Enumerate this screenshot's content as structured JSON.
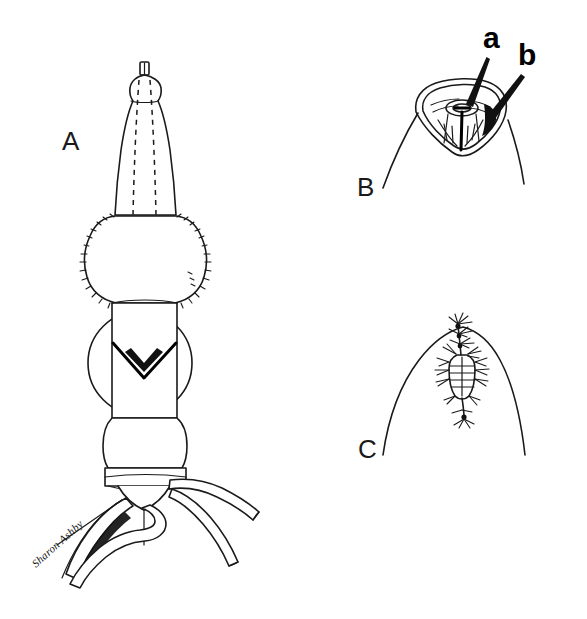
{
  "figure": {
    "background_color": "#ffffff",
    "ink_color": "#1a1a1a",
    "width": 587,
    "height": 619,
    "media": "pen-and-ink line drawing",
    "signature": "Sharon Ashby"
  },
  "panels": [
    {
      "id": "A",
      "label": "A",
      "label_x": 62,
      "label_y": 150,
      "subject": "whole-organism lateral view with elongated tapering head, fuzzy mid-body, circular detail inset and basal appendages"
    },
    {
      "id": "B",
      "label": "B",
      "label_x": 357,
      "label_y": 196,
      "subject": "apical tip detail showing triangular aperture with internal structures"
    },
    {
      "id": "C",
      "label": "C",
      "label_x": 358,
      "label_y": 458,
      "subject": "apical tip detail showing attached bristled organism"
    }
  ],
  "callouts": [
    {
      "label": "a",
      "label_x": 490,
      "label_y": 48,
      "line_x1": 486,
      "line_y1": 58,
      "line_x2": 472,
      "line_y2": 104,
      "target": "central aperture ring"
    },
    {
      "label": "b",
      "label_x": 524,
      "label_y": 65,
      "line_x1": 520,
      "line_y1": 75,
      "line_x2": 492,
      "line_y2": 115,
      "target": "inner chamber wall"
    }
  ],
  "detail_inset": {
    "shape": "circle",
    "center_x": 140,
    "center_y": 363,
    "radius": 52,
    "contains": "chevron marking"
  }
}
